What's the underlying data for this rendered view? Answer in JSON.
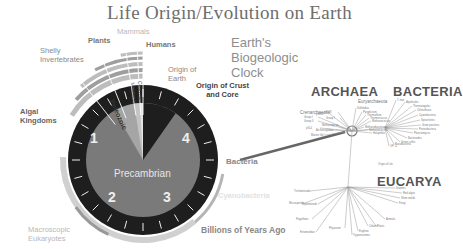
{
  "title": "Life Origin/Evolution on Earth",
  "clock": {
    "heading_lines": [
      "Earth's",
      "Biogeologic",
      "Clock"
    ],
    "center_label": "Precambrian",
    "hour_numbers": [
      "1",
      "2",
      "3",
      "4"
    ],
    "era_labels": [
      "Paleozoic",
      "Mesozoic",
      "Cenozoic"
    ],
    "axis_caption": "Billions of Years Ago",
    "events": {
      "mammals": "Mammals",
      "plants": "Plants",
      "humans": "Humans",
      "shelly_invertebrates": [
        "Shelly",
        "Invertebrates"
      ],
      "origin_of_earth": [
        "Origin of",
        "Earth"
      ],
      "origin_of_crust": [
        "Origin of Crust",
        "and Core"
      ],
      "algal_kingdoms": [
        "Algal",
        "Kingdoms"
      ],
      "bacteria": "Bacteria",
      "cyanobacteria": "Cyanobacteria",
      "macroscopic_eukaryotes": [
        "Macroscopic",
        "Eukaryotes"
      ]
    },
    "colors": {
      "face": "#7a7a7a",
      "rim": "#1e1e1e",
      "phanerozoic_wedge": "#9a9a9a",
      "outer_band": "#d0d0d0",
      "accent_band": "#8c8c8c"
    }
  },
  "tree": {
    "domains": [
      "ARCHAEA",
      "BACTERIA",
      "EUCARYA"
    ],
    "subgroups": [
      "Euryarchaeota",
      "Crenarchaeota"
    ],
    "archaea_labels": [
      "Group I",
      "Group II",
      "pSL50",
      "pSL78",
      "Group I",
      "pSL4",
      "Marine Gp I",
      "Sulfolobus",
      "Pyrodictium",
      "Thermofilum",
      "Thermococcus",
      "Methanococcus",
      "Methanobacterium",
      "Methanosarcina",
      "Halophiles",
      "Methanopyrus",
      "Archaeoglobus"
    ],
    "bacteria_labels": [
      "T. mar",
      "Aquificales",
      "Thermotogales",
      "Chloroflexus",
      "Cyanobacteria",
      "Spirochetes",
      "Gram positives",
      "Proteobacteria",
      "Planctomyces",
      "Bacteroides",
      "Green sulfur",
      "Flavobacteria",
      "OP 11"
    ],
    "eucarya_labels": [
      "Trichomonads",
      "Microsporidia",
      "Diplomonads",
      "Flagellates",
      "Entamoebae",
      "Physarum",
      "Trypanosomes",
      "Euglena",
      "Ciliates",
      "Plants",
      "Animals",
      "Fungi",
      "Slime molds",
      "Red algae",
      "Diatoms"
    ],
    "extra_label": "Origin of Life"
  }
}
